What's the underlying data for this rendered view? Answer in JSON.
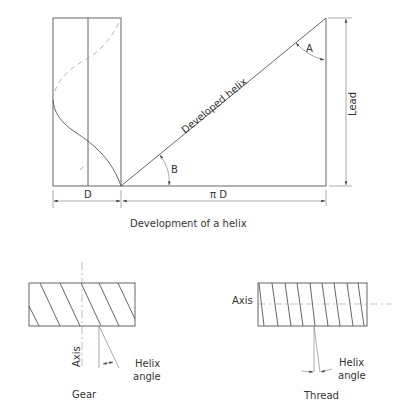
{
  "figure": {
    "top": {
      "caption": "Development of a helix",
      "labels": {
        "developed_helix": "Developed helix",
        "angle_a": "A",
        "angle_b": "B",
        "lead": "Lead",
        "diameter": "D",
        "circumference": "π D"
      }
    },
    "gear": {
      "caption": "Gear",
      "axis_label": "Axis",
      "helix_angle_label_1": "Helix",
      "helix_angle_label_2": "angle"
    },
    "thread": {
      "caption": "Thread",
      "axis_label": "Axis",
      "helix_angle_label_1": "Helix",
      "helix_angle_label_2": "angle"
    }
  }
}
